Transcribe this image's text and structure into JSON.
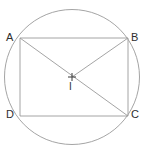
{
  "figure": {
    "type": "geometry-diagram",
    "background_color": "#ffffff",
    "stroke_color": "#9a9a9a",
    "label_color": "#2e2e2e",
    "stroke_width": 0.9
  },
  "circle": {
    "name": "circumscribed-circle",
    "center_x": 72,
    "center_y": 77,
    "radius": 67.5
  },
  "center_mark": {
    "name": "center-cross",
    "x": 72,
    "y": 77,
    "arm": 4
  },
  "points": [
    {
      "id": "A",
      "label": "A",
      "x": 20,
      "y": 38
    },
    {
      "id": "B",
      "label": "B",
      "x": 128,
      "y": 38
    },
    {
      "id": "C",
      "label": "C",
      "x": 128,
      "y": 116
    },
    {
      "id": "D",
      "label": "D",
      "x": 20,
      "y": 116
    },
    {
      "id": "I",
      "label": "I",
      "x": 72,
      "y": 77
    }
  ],
  "segments": [
    {
      "name": "side-AB",
      "from": "A",
      "to": "B",
      "x1": 20,
      "y1": 38,
      "x2": 128,
      "y2": 38
    },
    {
      "name": "side-BC",
      "from": "B",
      "to": "C",
      "x1": 128,
      "y1": 38,
      "x2": 128,
      "y2": 116
    },
    {
      "name": "side-CD",
      "from": "C",
      "to": "D",
      "x1": 128,
      "y1": 116,
      "x2": 20,
      "y2": 116
    },
    {
      "name": "side-DA",
      "from": "D",
      "to": "A",
      "x1": 20,
      "y1": 116,
      "x2": 20,
      "y2": 38
    },
    {
      "name": "diagonal-AC",
      "from": "A",
      "to": "C",
      "x1": 20,
      "y1": 38,
      "x2": 128,
      "y2": 116
    },
    {
      "name": "radius-BI",
      "from": "B",
      "to": "I",
      "x1": 128,
      "y1": 38,
      "x2": 72,
      "y2": 77
    }
  ],
  "labels": {
    "A": "A",
    "B": "B",
    "C": "C",
    "D": "D",
    "I": "I"
  }
}
